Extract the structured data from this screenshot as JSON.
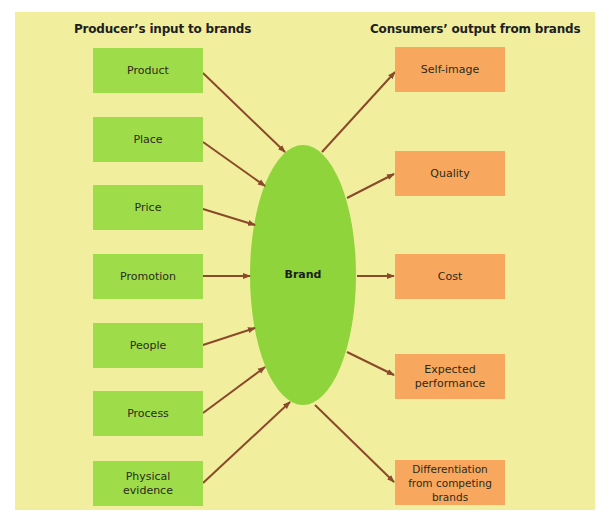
{
  "headings": {
    "left": "Producer’s input to brands",
    "right": "Consumers’ output from brands"
  },
  "center": {
    "label": "Brand",
    "color": "#8fd43a"
  },
  "inputs": [
    {
      "label": "Product"
    },
    {
      "label": "Place"
    },
    {
      "label": "Price"
    },
    {
      "label": "Promotion"
    },
    {
      "label": "People"
    },
    {
      "label": "Process"
    },
    {
      "label": "Physical evidence"
    }
  ],
  "outputs": [
    {
      "label": "Self-image"
    },
    {
      "label": "Quality"
    },
    {
      "label": "Cost"
    },
    {
      "label": "Expected performance"
    },
    {
      "label": "Differentiation from competing brands"
    }
  ],
  "colors": {
    "background": "#f1ee9e",
    "input_box": "#9fdc4a",
    "output_box": "#f7a85e",
    "arrow": "#8a4a2a"
  }
}
